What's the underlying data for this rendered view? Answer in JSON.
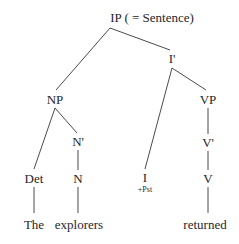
{
  "diagram": {
    "type": "syntax-tree",
    "title": "IP ( = Sentence)",
    "sentence": "The explorers returned",
    "background_color": "#ffffff",
    "line_color": "#4a4a52",
    "text_color": "#26262b",
    "nodes": {
      "ip": {
        "label": "IP ( = Sentence)",
        "x": 152,
        "y": 17
      },
      "ibar": {
        "label": "I'",
        "x": 172,
        "y": 58
      },
      "np": {
        "label": "NP",
        "x": 55,
        "y": 99
      },
      "vp": {
        "label": "VP",
        "x": 208,
        "y": 99
      },
      "nbar": {
        "label": "N'",
        "x": 78,
        "y": 141
      },
      "vbar": {
        "label": "V'",
        "x": 208,
        "y": 142
      },
      "det": {
        "label": "Det",
        "x": 34,
        "y": 178
      },
      "n": {
        "label": "N",
        "x": 78,
        "y": 178
      },
      "i": {
        "label": "I",
        "x": 145,
        "y": 177
      },
      "i_feature": {
        "label": "+Pst",
        "x": 145,
        "y": 190
      },
      "v": {
        "label": "V",
        "x": 208,
        "y": 178
      },
      "word_the": {
        "label": "The",
        "x": 34,
        "y": 224
      },
      "word_explorers": {
        "label": "explorers",
        "x": 79,
        "y": 224
      },
      "word_returned": {
        "label": "returned",
        "x": 205,
        "y": 224
      }
    },
    "edges": [
      {
        "from": "ip",
        "to": "np",
        "x1": 110,
        "y1": 28,
        "x2": 56,
        "y2": 90
      },
      {
        "from": "ip",
        "to": "ibar",
        "x1": 110,
        "y1": 28,
        "x2": 170,
        "y2": 50
      },
      {
        "from": "ibar",
        "to": "i",
        "x1": 172,
        "y1": 68,
        "x2": 145,
        "y2": 169
      },
      {
        "from": "ibar",
        "to": "vp",
        "x1": 172,
        "y1": 68,
        "x2": 206,
        "y2": 90
      },
      {
        "from": "np",
        "to": "det",
        "x1": 55,
        "y1": 108,
        "x2": 34,
        "y2": 169
      },
      {
        "from": "np",
        "to": "nbar",
        "x1": 55,
        "y1": 108,
        "x2": 77,
        "y2": 133
      },
      {
        "from": "nbar",
        "to": "n",
        "x1": 78,
        "y1": 150,
        "x2": 78,
        "y2": 170
      },
      {
        "from": "vp",
        "to": "vbar",
        "x1": 208,
        "y1": 108,
        "x2": 208,
        "y2": 134
      },
      {
        "from": "vbar",
        "to": "v",
        "x1": 208,
        "y1": 151,
        "x2": 208,
        "y2": 170
      },
      {
        "from": "det",
        "to": "word_the",
        "x1": 34,
        "y1": 187,
        "x2": 34,
        "y2": 213
      },
      {
        "from": "n",
        "to": "word_explorers",
        "x1": 78,
        "y1": 187,
        "x2": 78,
        "y2": 213
      },
      {
        "from": "v",
        "to": "word_returned",
        "x1": 208,
        "y1": 187,
        "x2": 208,
        "y2": 213
      }
    ]
  }
}
